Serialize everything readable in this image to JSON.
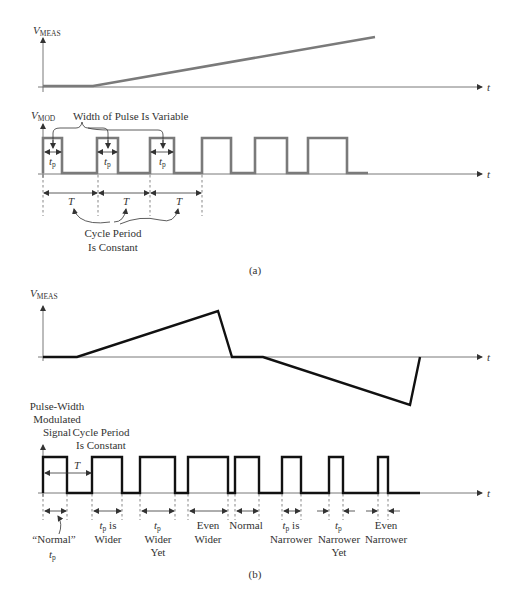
{
  "part_a": {
    "meas_label": {
      "v": "V",
      "sub": "MEAS"
    },
    "mod_label": {
      "v": "V",
      "sub": "MOD"
    },
    "time_label": "t",
    "width_note": "Width of Pulse Is Variable",
    "tp": {
      "t": "t",
      "sub": "p"
    },
    "period_label": "T",
    "cycle_note": [
      "Cycle Period",
      "Is Constant"
    ],
    "caption": "(a)"
  },
  "part_b": {
    "meas_label": {
      "v": "V",
      "sub": "MEAS"
    },
    "time_label": "t",
    "signal_label": [
      "Pulse-Width",
      "Modulated",
      "Signal"
    ],
    "cycle_note": [
      "Cycle Period",
      "Is Constant"
    ],
    "period_label": "T",
    "annotations": [
      {
        "lines": [
          "“Normal”"
        ],
        "tp_line": "t",
        "tp_sub": "p"
      },
      {
        "tp": "t",
        "tp_sub": "p",
        "rest": " is",
        "lines": [
          "Wider"
        ]
      },
      {
        "tp": "t",
        "tp_sub": "p",
        "lines": [
          "Wider",
          "Yet"
        ]
      },
      {
        "lines": [
          "Even",
          "Wider"
        ]
      },
      {
        "lines": [
          "Normal"
        ]
      },
      {
        "tp": "t",
        "tp_sub": "p",
        "rest": " is",
        "lines": [
          "Narrower"
        ]
      },
      {
        "tp": "t",
        "tp_sub": "p",
        "lines": [
          "Narrower",
          "Yet"
        ]
      },
      {
        "lines": [
          "Even",
          "Narrower"
        ]
      }
    ],
    "caption": "(b)"
  },
  "colors": {
    "part_a_waveform": "#7a7a7a",
    "part_b_waveform": "#111111",
    "axis": "#555555"
  }
}
